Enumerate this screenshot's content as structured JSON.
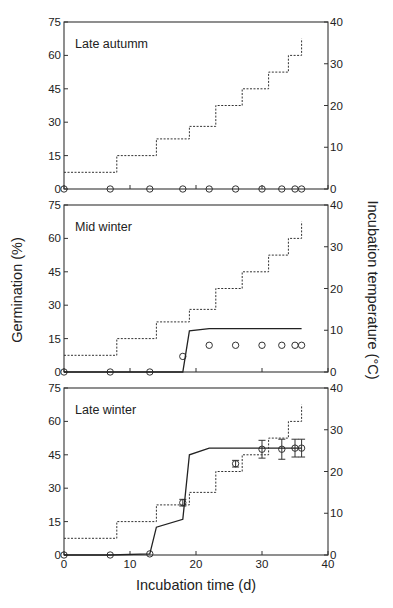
{
  "figure": {
    "y_left_title": "Germination (%)",
    "y_right_title": "Incubation temperature (°C)",
    "x_title": "Incubation time (d)"
  },
  "chart_data": [
    {
      "type": "line",
      "title": "Late autumm",
      "xlabel": "Incubation time (d)",
      "ylabel": "Germination (%)",
      "y2label": "Incubation temperature (°C)",
      "xlim": [
        0,
        40
      ],
      "ylim": [
        0,
        75
      ],
      "y2lim": [
        0,
        40
      ],
      "xticks": [
        0,
        10,
        20,
        30,
        40
      ],
      "yticks": [
        0,
        15,
        30,
        45,
        60,
        75
      ],
      "y2ticks": [
        0,
        10,
        20,
        30,
        40
      ],
      "grid": false,
      "series": [
        {
          "name": "Germination (observed)",
          "style": "open-circle",
          "axis": "left",
          "x": [
            0,
            7,
            13,
            18,
            22,
            26,
            30,
            33,
            35,
            36
          ],
          "y": [
            0,
            0,
            0,
            0,
            0,
            0,
            0,
            0,
            0,
            0
          ]
        },
        {
          "name": "Incubation temperature",
          "style": "dotted-step",
          "axis": "right",
          "x": [
            0,
            8,
            14,
            19,
            23,
            27,
            31,
            34,
            36
          ],
          "y": [
            4,
            8,
            12,
            15,
            20,
            24,
            28,
            32,
            36
          ]
        }
      ]
    },
    {
      "type": "line",
      "title": "Mid winter",
      "xlabel": "Incubation time (d)",
      "ylabel": "Germination (%)",
      "y2label": "Incubation temperature (°C)",
      "xlim": [
        0,
        40
      ],
      "ylim": [
        0,
        75
      ],
      "y2lim": [
        0,
        40
      ],
      "xticks": [
        0,
        10,
        20,
        30,
        40
      ],
      "yticks": [
        0,
        15,
        30,
        45,
        60,
        75
      ],
      "y2ticks": [
        0,
        10,
        20,
        30,
        40
      ],
      "grid": false,
      "series": [
        {
          "name": "Germination (observed)",
          "style": "open-circle",
          "axis": "left",
          "x": [
            0,
            7,
            13,
            18,
            22,
            26,
            30,
            33,
            35,
            36
          ],
          "y": [
            0,
            0,
            0,
            7,
            12,
            12,
            12,
            12,
            12,
            12
          ]
        },
        {
          "name": "Germination (model)",
          "style": "solid",
          "axis": "left",
          "x": [
            0,
            18,
            19,
            22,
            36
          ],
          "y": [
            0,
            0,
            18.5,
            19.5,
            19.5
          ]
        },
        {
          "name": "Incubation temperature",
          "style": "dotted-step",
          "axis": "right",
          "x": [
            0,
            8,
            14,
            19,
            23,
            27,
            31,
            34,
            36
          ],
          "y": [
            4,
            8,
            12,
            15,
            20,
            24,
            28,
            32,
            36
          ]
        }
      ]
    },
    {
      "type": "line",
      "title": "Late winter",
      "xlabel": "Incubation time (d)",
      "ylabel": "Germination (%)",
      "y2label": "Incubation temperature (°C)",
      "xlim": [
        0,
        40
      ],
      "ylim": [
        0,
        75
      ],
      "y2lim": [
        0,
        40
      ],
      "xticks": [
        0,
        10,
        20,
        30,
        40
      ],
      "yticks": [
        0,
        15,
        30,
        45,
        60,
        75
      ],
      "y2ticks": [
        0,
        10,
        20,
        30,
        40
      ],
      "grid": false,
      "series": [
        {
          "name": "Germination (observed)",
          "style": "open-circle-errorbar",
          "axis": "left",
          "x": [
            0,
            7,
            13,
            18,
            26,
            30,
            33,
            35,
            36
          ],
          "y": [
            0,
            0,
            0.5,
            23.5,
            41,
            47.5,
            47.5,
            48,
            48
          ],
          "err": [
            0,
            0,
            0,
            1.5,
            1.5,
            4,
            4.5,
            4,
            4
          ]
        },
        {
          "name": "Germination (model)",
          "style": "solid",
          "axis": "left",
          "x": [
            0,
            7,
            13,
            14,
            18,
            19,
            22,
            36
          ],
          "y": [
            0,
            0,
            0.5,
            12.5,
            16,
            45,
            48,
            48
          ]
        },
        {
          "name": "Incubation temperature",
          "style": "dotted-step",
          "axis": "right",
          "x": [
            0,
            8,
            14,
            19,
            23,
            27,
            31,
            34,
            36
          ],
          "y": [
            4,
            8,
            12,
            15,
            20,
            24,
            28,
            32,
            36
          ]
        }
      ]
    }
  ]
}
